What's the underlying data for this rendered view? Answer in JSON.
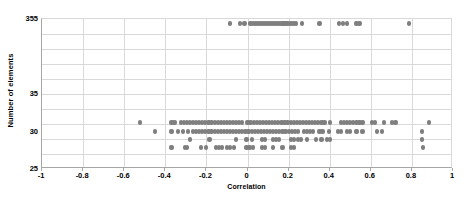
{
  "clipped_top_text": "",
  "axes": {
    "x_title": "Correlation",
    "y_title": "Number of elements"
  },
  "chart_data": {
    "type": "scatter",
    "title": "",
    "xlabel": "Correlation",
    "ylabel": "Number of elements",
    "xlim": [
      -1,
      1
    ],
    "x_ticks": [
      "-1",
      "-0.8",
      "-0.6",
      "-0.4",
      "-0.2",
      "0",
      "0.2",
      "0.4",
      "0.6",
      "0.8",
      "1"
    ],
    "x_tick_values": [
      -1,
      -0.8,
      -0.6,
      -0.4,
      -0.2,
      0,
      0.2,
      0.4,
      0.6,
      0.8,
      1
    ],
    "y_ticks": [
      "355",
      "35",
      "30",
      "25"
    ],
    "y_tick_labels_visible": [
      "355",
      "35",
      "30",
      "25"
    ],
    "y_axis_type": "broken-nonlinear",
    "y_gridline_count": 10,
    "grid": true,
    "legend": false,
    "marker": {
      "shape": "circle",
      "color": "#7f7f7f",
      "size_px": 4.2
    },
    "series": [
      {
        "name": "elements",
        "points_y355": [
          -0.085,
          -0.035,
          -0.015,
          0.015,
          0.025,
          0.035,
          0.045,
          0.055,
          0.065,
          0.075,
          0.085,
          0.095,
          0.105,
          0.115,
          0.125,
          0.135,
          0.145,
          0.155,
          0.165,
          0.175,
          0.185,
          0.195,
          0.205,
          0.215,
          0.225,
          0.235,
          0.265,
          0.35,
          0.445,
          0.465,
          0.485,
          0.53,
          0.545,
          0.785
        ],
        "points_y31": [
          -0.525,
          -0.37,
          -0.355,
          -0.325,
          -0.31,
          -0.295,
          -0.28,
          -0.265,
          -0.25,
          -0.235,
          -0.22,
          -0.205,
          -0.19,
          -0.175,
          -0.16,
          -0.145,
          -0.13,
          -0.115,
          -0.1,
          -0.085,
          -0.07,
          -0.055,
          -0.04,
          -0.025,
          0.0,
          0.015,
          0.03,
          0.045,
          0.06,
          0.075,
          0.09,
          0.105,
          0.12,
          0.135,
          0.15,
          0.165,
          0.18,
          0.195,
          0.21,
          0.225,
          0.24,
          0.255,
          0.27,
          0.285,
          0.3,
          0.315,
          0.33,
          0.345,
          0.36,
          0.375,
          0.4,
          0.455,
          0.47,
          0.485,
          0.5,
          0.515,
          0.53,
          0.545,
          0.56,
          0.605,
          0.62,
          0.665,
          0.705,
          0.72,
          0.885
        ],
        "points_y30": [
          -0.45,
          -0.37,
          -0.34,
          -0.315,
          -0.29,
          -0.265,
          -0.25,
          -0.235,
          -0.22,
          -0.205,
          -0.19,
          -0.175,
          -0.16,
          -0.145,
          -0.13,
          -0.115,
          -0.1,
          -0.085,
          -0.07,
          -0.055,
          -0.04,
          -0.025,
          -0.01,
          0.005,
          0.02,
          0.035,
          0.05,
          0.065,
          0.08,
          0.095,
          0.11,
          0.125,
          0.14,
          0.155,
          0.17,
          0.185,
          0.2,
          0.215,
          0.23,
          0.245,
          0.275,
          0.29,
          0.305,
          0.32,
          0.35,
          0.365,
          0.395,
          0.44,
          0.455,
          0.485,
          0.5,
          0.53,
          0.56,
          0.63,
          0.655,
          0.85
        ],
        "points_y29": [
          -0.28,
          -0.185,
          -0.055,
          -0.005,
          0.02,
          0.07,
          0.085,
          0.125,
          0.14,
          0.155,
          0.21,
          0.225,
          0.245,
          0.26,
          0.29,
          0.335,
          0.36,
          0.385,
          0.4,
          0.85
        ],
        "points_y28": [
          -0.37,
          -0.305,
          -0.295,
          -0.225,
          -0.2,
          -0.155,
          -0.14,
          -0.125,
          -0.1,
          -0.085,
          -0.065,
          -0.005,
          0.01,
          0.025,
          0.07,
          0.085,
          0.125,
          0.17,
          0.21,
          0.225,
          0.855
        ]
      }
    ]
  }
}
